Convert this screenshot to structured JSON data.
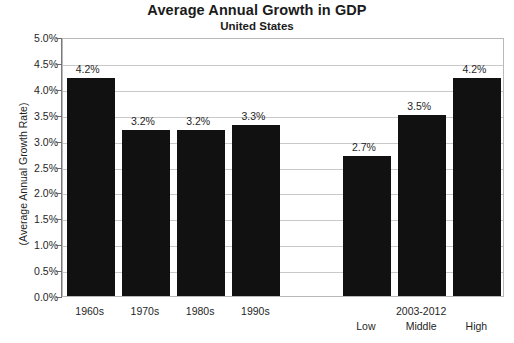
{
  "chart_data": {
    "type": "bar",
    "title": "Average Annual Growth in GDP",
    "subtitle": "United States",
    "ylabel": "(Average Annual Growth Rate)",
    "xlabel": "",
    "ylim": [
      0,
      5
    ],
    "ytick_labels": [
      "5.0%",
      "4.5%",
      "4.0%",
      "3.5%",
      "3.0%",
      "2.5%",
      "2.0%",
      "1.5%",
      "1.0%",
      "0.5%",
      "0.0%"
    ],
    "ytick_values": [
      5.0,
      4.5,
      4.0,
      3.5,
      3.0,
      2.5,
      2.0,
      1.5,
      1.0,
      0.5,
      0.0
    ],
    "grid": true,
    "legend": false,
    "categories": [
      "1960s",
      "1970s",
      "1980s",
      "1990s",
      "",
      "Low",
      "Middle",
      "High"
    ],
    "values": [
      4.2,
      3.2,
      3.2,
      3.3,
      null,
      2.7,
      3.5,
      4.2
    ],
    "data_labels": [
      "4.2%",
      "3.2%",
      "3.2%",
      "3.3%",
      "",
      "2.7%",
      "3.5%",
      "4.2%"
    ],
    "group_label": "2003-2012",
    "group_label_over_category": "Middle",
    "bar_color": "#111111",
    "grid_color": "#c9c9c9",
    "axis_color": "#7a7a7a",
    "background": "#ffffff"
  }
}
